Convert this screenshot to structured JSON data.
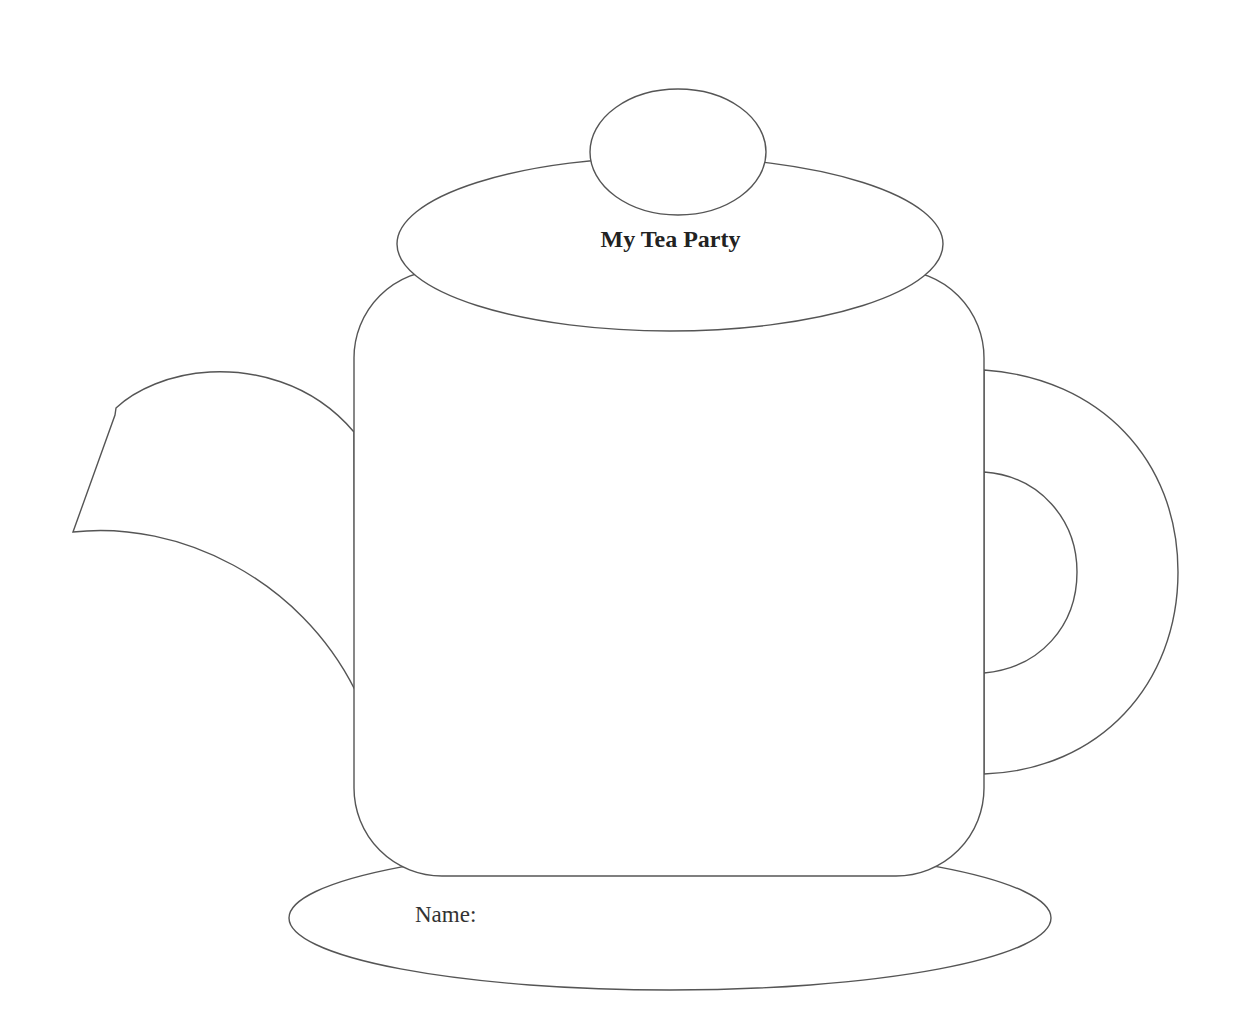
{
  "title": "My Tea Party",
  "name_label": "Name:",
  "colors": {
    "stroke": "#555555",
    "background": "#ffffff"
  }
}
